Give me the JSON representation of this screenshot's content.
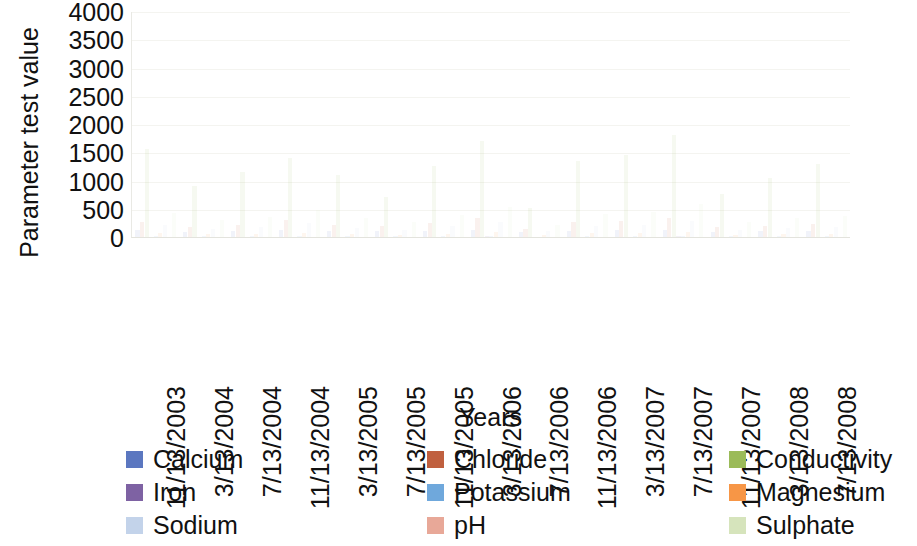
{
  "chart_data": {
    "type": "bar",
    "title": "",
    "xlabel": "Years",
    "ylabel": "Parameter test value",
    "ylim": [
      0,
      4000
    ],
    "y_ticks": [
      4000,
      3500,
      3000,
      2500,
      2000,
      1500,
      1000,
      500,
      0
    ],
    "grid": true,
    "legend_position": "bottom",
    "legend_columns": 3,
    "categories": [
      "11/13/2003",
      "3/13/2004",
      "7/13/2004",
      "11/13/2004",
      "3/13/2005",
      "7/13/2005",
      "11/13/2005",
      "3/13/2006",
      "7/13/2006",
      "11/13/2006",
      "3/13/2007",
      "7/13/2007",
      "11/13/2007",
      "3/13/2008",
      "7/13/2008"
    ],
    "series": [
      {
        "name": "Calcium",
        "color": "#5B77C0",
        "values": [
          120,
          95,
          110,
          130,
          105,
          100,
          115,
          125,
          90,
          110,
          120,
          130,
          95,
          105,
          110
        ]
      },
      {
        "name": "Chloride",
        "color": "#C0603F",
        "values": [
          260,
          180,
          220,
          300,
          210,
          190,
          240,
          330,
          150,
          260,
          280,
          340,
          170,
          200,
          230
        ]
      },
      {
        "name": "Conductivity",
        "color": "#9BBB59",
        "values": [
          1550,
          900,
          1150,
          1400,
          1100,
          700,
          1250,
          1700,
          520,
          1350,
          1450,
          1800,
          760,
          1050,
          1300
        ]
      },
      {
        "name": "Iron",
        "color": "#7E62A3",
        "values": [
          8,
          5,
          6,
          9,
          5,
          4,
          7,
          10,
          3,
          7,
          8,
          11,
          4,
          6,
          7
        ]
      },
      {
        "name": "Potassium",
        "color": "#6FA8DC",
        "values": [
          18,
          12,
          15,
          20,
          14,
          11,
          16,
          22,
          9,
          17,
          18,
          24,
          10,
          13,
          15
        ]
      },
      {
        "name": "Magnesium",
        "color": "#F79646",
        "values": [
          70,
          48,
          58,
          78,
          52,
          44,
          62,
          86,
          36,
          66,
          72,
          92,
          42,
          54,
          60
        ]
      },
      {
        "name": "Sodium",
        "color": "#C3D3EA",
        "values": [
          210,
          140,
          175,
          240,
          160,
          130,
          190,
          270,
          110,
          200,
          220,
          290,
          130,
          165,
          185
        ]
      },
      {
        "name": "pH",
        "color": "#E8A898",
        "values": [
          7.4,
          7.2,
          7.5,
          7.3,
          7.6,
          7.1,
          7.4,
          7.5,
          7.2,
          7.3,
          7.4,
          7.6,
          7.2,
          7.3,
          7.5
        ]
      },
      {
        "name": "Sulphate",
        "color": "#D6E4BC",
        "values": [
          430,
          300,
          360,
          480,
          330,
          270,
          390,
          540,
          220,
          410,
          450,
          580,
          270,
          340,
          380
        ]
      }
    ]
  },
  "legend": {
    "items": [
      {
        "label": "Calcium",
        "color": "#5B77C0"
      },
      {
        "label": "Chloride",
        "color": "#C0603F"
      },
      {
        "label": "Conductivity",
        "color": "#9BBB59"
      },
      {
        "label": "Iron",
        "color": "#7E62A3"
      },
      {
        "label": "Potassium",
        "color": "#6FA8DC"
      },
      {
        "label": "Magnesium",
        "color": "#F79646"
      },
      {
        "label": "Sodium",
        "color": "#C3D3EA"
      },
      {
        "label": "pH",
        "color": "#E8A898"
      },
      {
        "label": "Sulphate",
        "color": "#D6E4BC"
      }
    ]
  }
}
